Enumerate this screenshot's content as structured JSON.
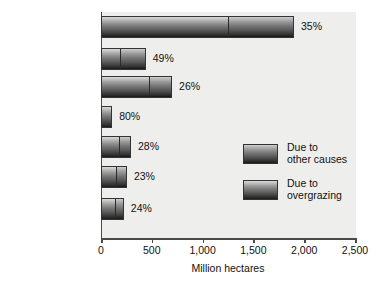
{
  "chart_data": {
    "type": "bar",
    "orientation": "horizontal",
    "stacked": true,
    "title": "",
    "xlabel": "Million hectares",
    "ylabel": "",
    "xlim": [
      0,
      2500
    ],
    "xticks": [
      "0",
      "500",
      "1,000",
      "1,500",
      "2,000",
      "2,500"
    ],
    "xtick_values": [
      0,
      500,
      1000,
      1500,
      2000,
      2500
    ],
    "grid": false,
    "legend_position": "inside-right",
    "categories": [
      "World",
      "Africa",
      "Asia",
      "Oceania",
      "South America",
      "Europe",
      "North and\nCentral America"
    ],
    "series": [
      {
        "name": "Due to\novergrazing",
        "values": [
          1250,
          185,
          480,
          110,
          175,
          145,
          140
        ]
      },
      {
        "name": "Due to\nother causes",
        "values": [
          650,
          255,
          220,
          0,
          120,
          110,
          85
        ]
      }
    ],
    "totals": [
      1900,
      440,
      700,
      110,
      295,
      255,
      225
    ],
    "annotations": [
      "35%",
      "49%",
      "26%",
      "80%",
      "28%",
      "23%",
      "24%"
    ],
    "colors": {
      "overgrazing_light": "#d9d9d9",
      "overgrazing_dark": "#1d1d1d",
      "other_light": "#cfcfcf",
      "other_dark": "#191919",
      "plot_background": "#eeeeec",
      "axis": "#4a4a4a",
      "text": "#111111"
    }
  },
  "legend": {
    "items": [
      {
        "label": "Due to\nother causes",
        "swatch": "other-causes-swatch"
      },
      {
        "label": "Due to\novergrazing",
        "swatch": "overgrazing-swatch"
      }
    ]
  }
}
